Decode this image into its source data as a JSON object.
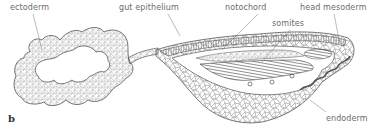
{
  "figure": {
    "panel_label": "b",
    "labels": {
      "ectoderm": "ectoderm",
      "gut_epithelium": "gut epithelium",
      "notochord": "notochord",
      "somites": "somites",
      "head_mesoderm": "head mesoderm",
      "endoderm": "endoderm"
    },
    "colors": {
      "line": "#555555",
      "cell": "#8a8a8a",
      "text": "#6b6b6b"
    }
  }
}
